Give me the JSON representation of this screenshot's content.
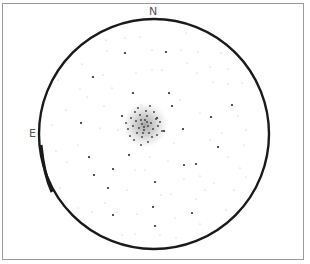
{
  "sketch": {
    "subject": "globular cluster eyepiece sketch",
    "orientation": {
      "north_label": "N",
      "east_label": "E"
    },
    "field_of_view": {
      "center": [
        154,
        134
      ],
      "radius": 115,
      "stroke_color": "#1a1a1a"
    },
    "frame_color": "#9a9a9a",
    "cluster": {
      "center": [
        145,
        125
      ],
      "halo_radius": 24,
      "core_color": "#555555"
    },
    "bright_stars": [
      [
        125,
        53
      ],
      [
        166,
        52
      ],
      [
        93,
        77
      ],
      [
        133,
        93
      ],
      [
        169,
        93
      ],
      [
        122,
        116
      ],
      [
        157,
        118
      ],
      [
        89,
        157
      ],
      [
        94,
        175
      ],
      [
        113,
        169
      ],
      [
        164,
        131
      ],
      [
        183,
        129
      ],
      [
        184,
        165
      ],
      [
        211,
        117
      ],
      [
        196,
        164
      ],
      [
        218,
        147
      ],
      [
        153,
        207
      ],
      [
        192,
        213
      ],
      [
        155,
        226
      ],
      [
        113,
        215
      ],
      [
        108,
        188
      ],
      [
        129,
        155
      ],
      [
        81,
        123
      ],
      [
        155,
        182
      ],
      [
        232,
        105
      ],
      [
        172,
        106
      ]
    ],
    "faint_stars": [
      [
        106,
        40
      ],
      [
        125,
        38
      ],
      [
        140,
        37
      ],
      [
        186,
        33
      ],
      [
        152,
        50
      ],
      [
        198,
        52
      ],
      [
        221,
        53
      ],
      [
        107,
        51
      ],
      [
        181,
        50
      ],
      [
        82,
        64
      ],
      [
        187,
        63
      ],
      [
        210,
        67
      ],
      [
        228,
        69
      ],
      [
        58,
        80
      ],
      [
        80,
        89
      ],
      [
        103,
        75
      ],
      [
        162,
        70
      ],
      [
        197,
        73
      ],
      [
        242,
        83
      ],
      [
        112,
        88
      ],
      [
        213,
        82
      ],
      [
        228,
        84
      ],
      [
        66,
        110
      ],
      [
        52,
        125
      ],
      [
        56,
        151
      ],
      [
        67,
        162
      ],
      [
        78,
        145
      ],
      [
        100,
        128
      ],
      [
        104,
        106
      ],
      [
        87,
        97
      ],
      [
        136,
        73
      ],
      [
        152,
        70
      ],
      [
        141,
        105
      ],
      [
        118,
        130
      ],
      [
        180,
        100
      ],
      [
        200,
        113
      ],
      [
        238,
        116
      ],
      [
        246,
        130
      ],
      [
        244,
        145
      ],
      [
        222,
        133
      ],
      [
        210,
        140
      ],
      [
        228,
        157
      ],
      [
        240,
        168
      ],
      [
        174,
        143
      ],
      [
        184,
        179
      ],
      [
        200,
        176
      ],
      [
        214,
        183
      ],
      [
        234,
        190
      ],
      [
        246,
        177
      ],
      [
        60,
        188
      ],
      [
        78,
        208
      ],
      [
        92,
        212
      ],
      [
        117,
        212
      ],
      [
        137,
        214
      ],
      [
        161,
        195
      ],
      [
        171,
        194
      ],
      [
        196,
        199
      ],
      [
        205,
        190
      ],
      [
        226,
        210
      ],
      [
        175,
        218
      ],
      [
        200,
        224
      ],
      [
        135,
        234
      ],
      [
        160,
        235
      ],
      [
        122,
        235
      ],
      [
        176,
        238
      ],
      [
        95,
        232
      ],
      [
        168,
        161
      ],
      [
        135,
        170
      ],
      [
        145,
        170
      ],
      [
        150,
        157
      ],
      [
        127,
        190
      ],
      [
        105,
        203
      ]
    ],
    "cluster_stars": [
      [
        145,
        120
      ],
      [
        142,
        124
      ],
      [
        148,
        126
      ],
      [
        139,
        128
      ],
      [
        151,
        123
      ],
      [
        144,
        130
      ],
      [
        136,
        121
      ],
      [
        153,
        129
      ],
      [
        147,
        116
      ],
      [
        140,
        115
      ],
      [
        133,
        126
      ],
      [
        156,
        119
      ],
      [
        149,
        133
      ],
      [
        137,
        133
      ],
      [
        142,
        137
      ],
      [
        152,
        137
      ],
      [
        158,
        126
      ],
      [
        131,
        118
      ],
      [
        146,
        111
      ],
      [
        154,
        112
      ],
      [
        135,
        112
      ],
      [
        160,
        122
      ],
      [
        128,
        129
      ],
      [
        134,
        140
      ],
      [
        148,
        142
      ],
      [
        141,
        145
      ],
      [
        130,
        136
      ],
      [
        157,
        135
      ],
      [
        138,
        108
      ],
      [
        150,
        106
      ],
      [
        126,
        123
      ],
      [
        162,
        131
      ],
      [
        144,
        127
      ],
      [
        147,
        122
      ],
      [
        141,
        120
      ],
      [
        143,
        133
      ]
    ]
  }
}
